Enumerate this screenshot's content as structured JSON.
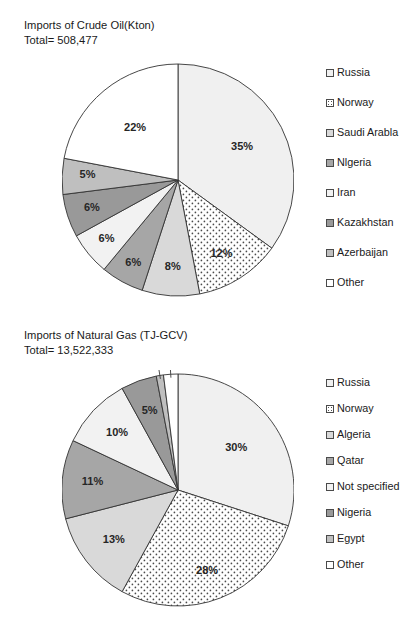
{
  "charts": [
    {
      "id": "crude-oil",
      "title_line1": "Imports of Crude Oil(Kton)",
      "title_line2": "Total= 508,477",
      "legend": [
        {
          "label": "Russia",
          "color": "#f0f0f0",
          "pattern": "solid"
        },
        {
          "label": "Norway",
          "color": "#ffffff",
          "pattern": "dotted"
        },
        {
          "label": "Saudi Arabla",
          "color": "#d9d9d9",
          "pattern": "solid"
        },
        {
          "label": "Nlgeria",
          "color": "#a6a6a6",
          "pattern": "solid"
        },
        {
          "label": "Iran",
          "color": "#f2f2f2",
          "pattern": "solid"
        },
        {
          "label": "Kazakhstan",
          "color": "#999999",
          "pattern": "solid"
        },
        {
          "label": "Azerbaijan",
          "color": "#bfbfbf",
          "pattern": "solid"
        },
        {
          "label": "Other",
          "color": "#ffffff",
          "pattern": "solid"
        }
      ]
    },
    {
      "id": "natural-gas",
      "title_line1": "Imports of Natural Gas (TJ-GCV)",
      "title_line2": "Total= 13,522,333",
      "legend": [
        {
          "label": "Russia",
          "color": "#f0f0f0",
          "pattern": "solid"
        },
        {
          "label": "Norway",
          "color": "#ffffff",
          "pattern": "dotted"
        },
        {
          "label": "Algeria",
          "color": "#d9d9d9",
          "pattern": "solid"
        },
        {
          "label": "Qatar",
          "color": "#a6a6a6",
          "pattern": "solid"
        },
        {
          "label": "Not specified",
          "color": "#f2f2f2",
          "pattern": "solid"
        },
        {
          "label": "Nigeria",
          "color": "#999999",
          "pattern": "solid"
        },
        {
          "label": "Egypt",
          "color": "#bfbfbf",
          "pattern": "solid"
        },
        {
          "label": "Other",
          "color": "#ffffff",
          "pattern": "solid"
        }
      ]
    }
  ],
  "chart_data": [
    {
      "type": "pie",
      "title": "Imports of Crude Oil(Kton)",
      "subtitle": "Total= 508,477",
      "total": "508,477",
      "unit": "Kton",
      "legend_position": "right",
      "start_angle_deg": 0,
      "direction": "clockwise",
      "labels": [
        "Russia",
        "Norway",
        "Saudi Arabla",
        "Nlgeria",
        "Iran",
        "Kazakhstan",
        "Azerbaijan",
        "Other"
      ],
      "values": [
        35,
        12,
        8,
        6,
        6,
        6,
        5,
        22
      ],
      "value_labels": [
        "35%",
        "12%",
        "8%",
        "6%",
        "6%",
        "6%",
        "5%",
        "22%"
      ],
      "colors": [
        "#f0f0f0",
        "#ffffff",
        "#d9d9d9",
        "#a6a6a6",
        "#f2f2f2",
        "#999999",
        "#bfbfbf",
        "#ffffff"
      ],
      "patterns": [
        "solid",
        "dotted",
        "solid",
        "solid",
        "solid",
        "solid",
        "solid",
        "solid"
      ]
    },
    {
      "type": "pie",
      "title": "Imports of Natural Gas (TJ-GCV)",
      "subtitle": "Total= 13,522,333",
      "total": "13,522,333",
      "unit": "TJ-GCV",
      "legend_position": "right",
      "start_angle_deg": 0,
      "direction": "clockwise",
      "labels": [
        "Russia",
        "Norway",
        "Algeria",
        "Qatar",
        "Not specified",
        "Nigeria",
        "Egypt",
        "Other"
      ],
      "values": [
        30,
        28,
        13,
        11,
        10,
        5,
        1,
        2
      ],
      "value_labels": [
        "30%",
        "28%",
        "13%",
        "11%",
        "10%",
        "5%",
        "1%",
        "2%"
      ],
      "colors": [
        "#f0f0f0",
        "#ffffff",
        "#d9d9d9",
        "#a6a6a6",
        "#f2f2f2",
        "#999999",
        "#bfbfbf",
        "#ffffff"
      ],
      "patterns": [
        "solid",
        "dotted",
        "solid",
        "solid",
        "solid",
        "solid",
        "solid",
        "solid"
      ]
    }
  ]
}
